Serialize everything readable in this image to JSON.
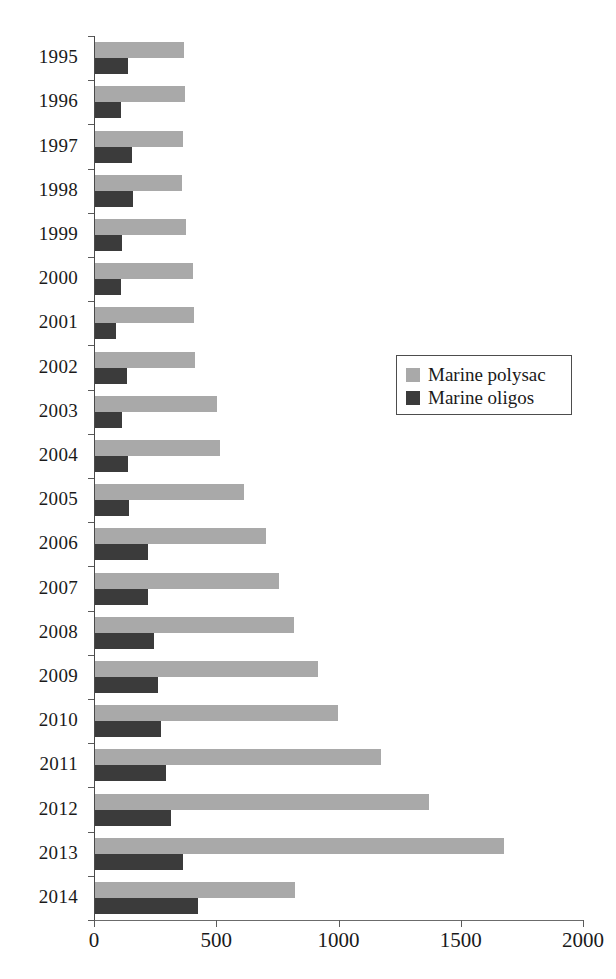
{
  "chart_data": {
    "type": "bar",
    "orientation": "horizontal",
    "title": "",
    "xlabel": "",
    "ylabel": "",
    "xlim": [
      0,
      2000
    ],
    "xticks": [
      0,
      500,
      1000,
      1500,
      2000
    ],
    "xtick_labels": [
      "0",
      "500",
      "1000",
      "1500",
      "2000"
    ],
    "grid": false,
    "legend_position": "center-right",
    "categories": [
      "1995",
      "1996",
      "1997",
      "1998",
      "1999",
      "2000",
      "2001",
      "2002",
      "2003",
      "2004",
      "2005",
      "2006",
      "2007",
      "2008",
      "2009",
      "2010",
      "2011",
      "2012",
      "2013",
      "2014"
    ],
    "series": [
      {
        "name": "Marine polysac",
        "color": "#a9a9a9",
        "values": [
          365,
          368,
          360,
          355,
          372,
          400,
          404,
          410,
          500,
          512,
          610,
          700,
          752,
          813,
          912,
          993,
          1170,
          1365,
          1672,
          818
        ]
      },
      {
        "name": "Marine oligos",
        "color": "#3b3b3b",
        "values": [
          135,
          107,
          150,
          155,
          110,
          108,
          85,
          130,
          112,
          135,
          139,
          215,
          218,
          240,
          258,
          270,
          292,
          310,
          360,
          421
        ]
      }
    ]
  },
  "legend": {
    "items": [
      {
        "label": "Marine polysac",
        "swatch": "polysac"
      },
      {
        "label": "Marine oligos",
        "swatch": "oligos"
      }
    ]
  },
  "colors": {
    "series_light": "#a9a9a9",
    "series_dark": "#3b3b3b",
    "axis": "#4a4a4a",
    "background": "#ffffff"
  }
}
